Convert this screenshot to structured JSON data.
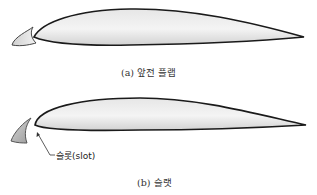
{
  "figure": {
    "panel_a": {
      "caption": "(a) 앞전 플랩",
      "parts": [
        "main-airfoil",
        "leading-edge-flap"
      ]
    },
    "panel_b": {
      "caption": "(b) 슬랫",
      "parts": [
        "main-airfoil",
        "slat"
      ],
      "annotation": "슬롯(slot)"
    }
  },
  "colors": {
    "outline": "#1a1a1a",
    "fill_light": "#f2f2f2",
    "fill_dark": "#c8c8c8"
  }
}
